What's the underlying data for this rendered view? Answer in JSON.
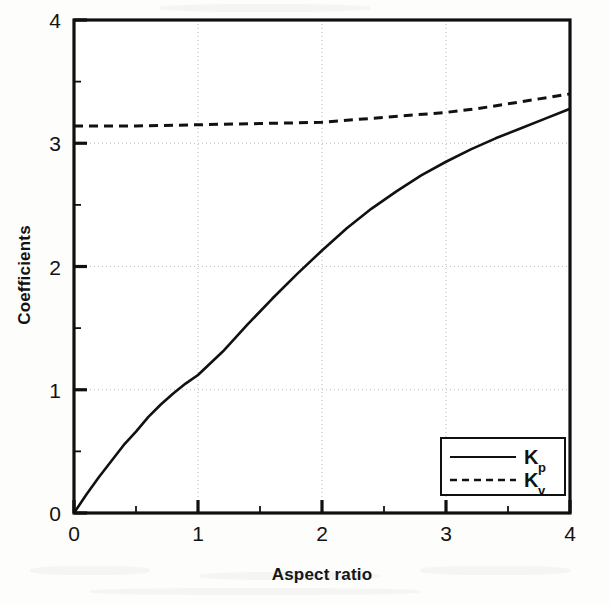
{
  "chart_data": {
    "type": "line",
    "title": "",
    "xlabel": "Aspect ratio",
    "ylabel": "Coefficients",
    "xlim": [
      0,
      4
    ],
    "ylim": [
      0,
      4
    ],
    "xticks": [
      0,
      1,
      2,
      3,
      4
    ],
    "xticklabels": [
      "0",
      "1",
      "2",
      "3",
      "4"
    ],
    "yticks": [
      0,
      1,
      2,
      3,
      4
    ],
    "yticklabels": [
      "0",
      "1",
      "2",
      "3",
      "4"
    ],
    "minor_tick_step": 0.5,
    "grid": "dotted gridlines at major ticks",
    "legend_position": "lower right",
    "series": [
      {
        "name": "Kp",
        "label_base": "K",
        "label_sub": "p",
        "style": "solid",
        "color": "#111111",
        "x": [
          0,
          0.1,
          0.2,
          0.3,
          0.4,
          0.5,
          0.6,
          0.7,
          0.8,
          0.9,
          1.0,
          1.2,
          1.4,
          1.6,
          1.8,
          2.0,
          2.2,
          2.4,
          2.6,
          2.8,
          3.0,
          3.2,
          3.4,
          3.6,
          3.8,
          4.0
        ],
        "values": [
          0.0,
          0.15,
          0.29,
          0.42,
          0.55,
          0.66,
          0.78,
          0.88,
          0.97,
          1.05,
          1.12,
          1.31,
          1.53,
          1.74,
          1.94,
          2.13,
          2.31,
          2.47,
          2.61,
          2.74,
          2.85,
          2.95,
          3.04,
          3.12,
          3.2,
          3.28
        ]
      },
      {
        "name": "Kv",
        "label_base": "K",
        "label_sub": "v",
        "style": "dashed",
        "color": "#111111",
        "x": [
          0,
          0.5,
          1.0,
          1.5,
          2.0,
          2.25,
          2.5,
          2.75,
          3.0,
          3.25,
          3.5,
          3.75,
          4.0
        ],
        "values": [
          3.14,
          3.14,
          3.15,
          3.16,
          3.17,
          3.19,
          3.21,
          3.23,
          3.25,
          3.28,
          3.32,
          3.36,
          3.4
        ]
      }
    ]
  },
  "axes": {
    "x_title": "Aspect ratio",
    "y_title": "Coefficients"
  },
  "legend": {
    "items": [
      {
        "base": "K",
        "sub": "p",
        "style": "solid"
      },
      {
        "base": "K",
        "sub": "v",
        "style": "dashed"
      }
    ]
  }
}
